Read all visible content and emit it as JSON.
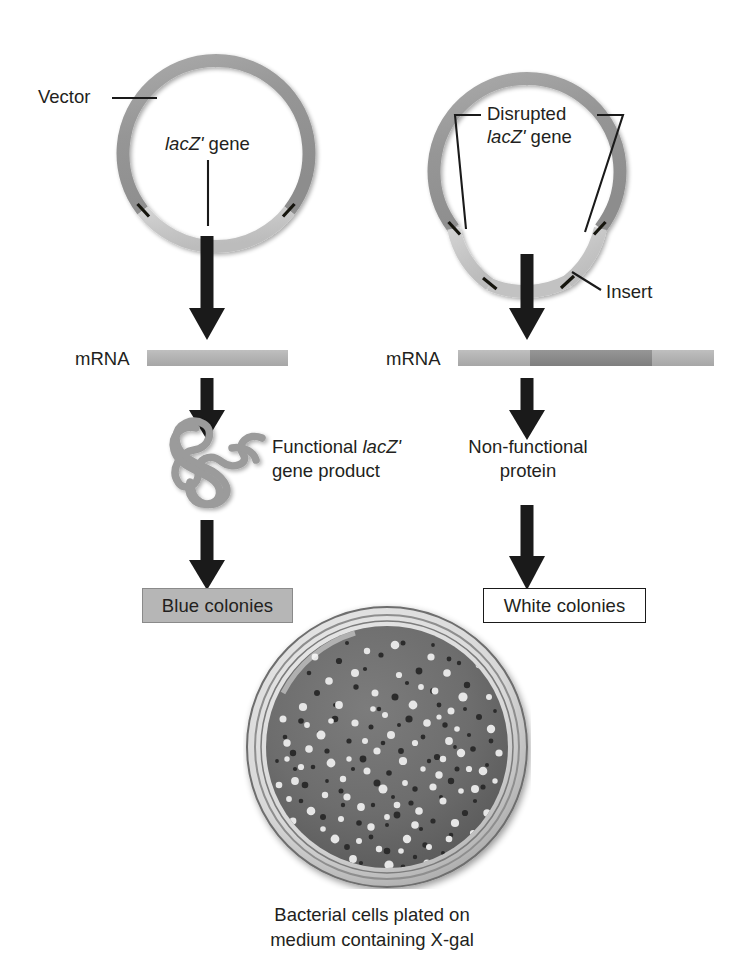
{
  "figure": {
    "caption_line1": "Bacterial cells plated on",
    "caption_line2": "medium containing X-gal"
  },
  "colors": {
    "vector_ring": "#999999",
    "lacz_segment": "#c8c8c8",
    "insert_segment": "#c2c2c2",
    "mrna_light": "#b4b4b4",
    "mrna_dark": "#8c8c8c",
    "arrow": "#1a1a1a",
    "protein": "#9a9a9a",
    "blue_box_fill": "#b6b6b6",
    "white_box_fill": "#ffffff",
    "text": "#231f20",
    "petri_medium": "#6e6e6e"
  },
  "left_branch": {
    "plasmid": {
      "name": "intact-plasmid",
      "vector_label": "Vector",
      "gene_label_italic": "lacZ'",
      "gene_label_rest": " gene"
    },
    "mrna": {
      "label": "mRNA",
      "segments": [
        {
          "name": "lacz-transcript",
          "shade": "light",
          "width_pct": 100
        }
      ]
    },
    "protein": {
      "label_line1_italic_prefix": "Functional ",
      "label_line1_italic": "lacZ'",
      "label_line2": "gene product",
      "shape": "folded-squiggle"
    },
    "result": {
      "label": "Blue colonies",
      "style": "filled-gray"
    }
  },
  "right_branch": {
    "plasmid": {
      "name": "recombinant-plasmid",
      "disrupted_label_line1": "Disrupted",
      "disrupted_label_line2_italic": "lacZ'",
      "disrupted_label_line2_rest": " gene",
      "insert_label": "Insert"
    },
    "mrna": {
      "label": "mRNA",
      "segments": [
        {
          "name": "lacz-5prime",
          "shade": "light",
          "width_pct": 27
        },
        {
          "name": "insert-transcript",
          "shade": "dark",
          "width_pct": 50
        },
        {
          "name": "lacz-3prime",
          "shade": "light",
          "width_pct": 23
        }
      ]
    },
    "protein": {
      "label_line1": "Non-functional",
      "label_line2": "protein"
    },
    "result": {
      "label": "White colonies",
      "style": "outlined-white"
    }
  },
  "petri_dish": {
    "name": "petri-dish-photo",
    "medium_description": "agar plate with X-gal",
    "white_colony_count": 118,
    "blue_colony_count": 140
  },
  "arrows": [
    {
      "name": "arrow-left-transcription"
    },
    {
      "name": "arrow-left-translation"
    },
    {
      "name": "arrow-left-phenotype"
    },
    {
      "name": "arrow-right-transcription"
    },
    {
      "name": "arrow-right-translation"
    },
    {
      "name": "arrow-right-phenotype"
    }
  ]
}
